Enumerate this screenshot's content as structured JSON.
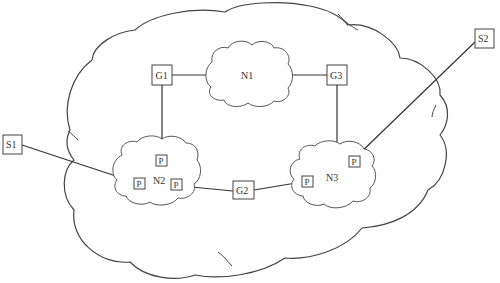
{
  "diagram": {
    "type": "network-topology",
    "colors": {
      "line": "#333333",
      "background": "#ffffff",
      "text": "#333333"
    },
    "outer_network": {
      "label": ""
    },
    "networks": [
      {
        "id": "N1",
        "label": "N1"
      },
      {
        "id": "N2",
        "label": "N2"
      },
      {
        "id": "N3",
        "label": "N3"
      }
    ],
    "gateways": [
      {
        "id": "G1",
        "label": "G1"
      },
      {
        "id": "G2",
        "label": "G2"
      },
      {
        "id": "G3",
        "label": "G3"
      }
    ],
    "stations": [
      {
        "id": "S1",
        "label": "S1"
      },
      {
        "id": "S2",
        "label": "S2"
      }
    ],
    "ports": [
      {
        "id": "P_N2_top",
        "label": "P",
        "network": "N2"
      },
      {
        "id": "P_N2_left",
        "label": "P",
        "network": "N2"
      },
      {
        "id": "P_N2_right",
        "label": "P",
        "network": "N2"
      },
      {
        "id": "P_N3_left",
        "label": "P",
        "network": "N3"
      },
      {
        "id": "P_N3_top",
        "label": "P",
        "network": "N3"
      }
    ],
    "links": [
      {
        "from": "G1",
        "to": "N1"
      },
      {
        "from": "N1",
        "to": "G3"
      },
      {
        "from": "G1",
        "to": "P_N2_top"
      },
      {
        "from": "G3",
        "to": "N3"
      },
      {
        "from": "S1",
        "to": "P_N2_left"
      },
      {
        "from": "P_N2_right",
        "to": "G2"
      },
      {
        "from": "G2",
        "to": "P_N3_left"
      },
      {
        "from": "S2",
        "to": "P_N3_top"
      }
    ]
  }
}
